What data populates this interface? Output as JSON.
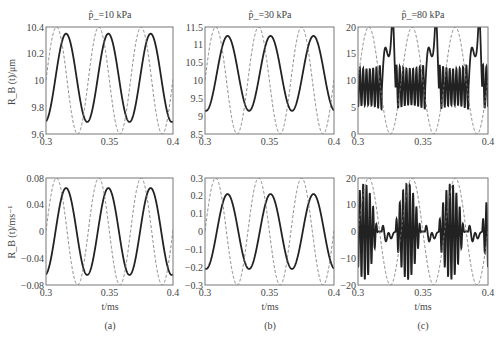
{
  "figure": {
    "captions": [
      "(a)",
      "(b)",
      "(c)"
    ],
    "xlabel": "t/ms",
    "top_ylabel": "R_B (t)/μm",
    "bottom_ylabel": "R_B (t)/ms⁻¹",
    "column_titles": [
      "p̂_=10 kPa",
      "p̂_=30 kPa",
      "p̂_=80 kPa"
    ]
  },
  "chart_data": [
    {
      "type": "line",
      "panel": "a-top",
      "title": "p̂_=10 kPa",
      "xlabel": "",
      "ylabel": "R_B (t)/μm",
      "xlim": [
        0.3,
        0.4
      ],
      "ylim": [
        9.6,
        10.4
      ],
      "xticks": [
        0.3,
        0.35,
        0.4
      ],
      "yticks": [
        9.6,
        9.8,
        10,
        10.2,
        10.4
      ],
      "ytick_labels": [
        "9.6",
        "9.8",
        "10",
        "10.2",
        "10.4"
      ],
      "series": [
        {
          "name": "bubble radius",
          "style": "solid",
          "mean": 10.02,
          "amplitude": 0.33,
          "period_ms": 0.0333,
          "first_peak_t": 0.3158,
          "peaks": [
            10.36,
            10.36,
            10.36
          ],
          "troughs": [
            9.69,
            9.69,
            9.69
          ]
        },
        {
          "name": "driving pressure (scaled)",
          "style": "dashed",
          "mean": 10.0,
          "amplitude": 0.4,
          "period_ms": 0.0333,
          "first_peak_t": 0.3083
        }
      ],
      "grid": false
    },
    {
      "type": "line",
      "panel": "b-top",
      "title": "p̂_=30 kPa",
      "xlabel": "",
      "ylabel": "",
      "xlim": [
        0.3,
        0.4
      ],
      "ylim": [
        8.5,
        11.5
      ],
      "xticks": [
        0.3,
        0.35,
        0.4
      ],
      "yticks": [
        8.5,
        9,
        9.5,
        10,
        10.5,
        11,
        11.5
      ],
      "ytick_labels": [
        "8.5",
        "9",
        "9.5",
        "10",
        "10.5",
        "11",
        "11.5"
      ],
      "series": [
        {
          "name": "bubble radius",
          "style": "solid",
          "mean": 10.2,
          "amplitude": 1.05,
          "period_ms": 0.0333,
          "first_peak_t": 0.3175,
          "peaks": [
            11.3,
            11.3,
            11.3
          ],
          "troughs": [
            9.1,
            9.2,
            9.2
          ]
        },
        {
          "name": "driving pressure (scaled)",
          "style": "dashed",
          "mean": 10.0,
          "amplitude": 1.5,
          "period_ms": 0.0333,
          "first_peak_t": 0.3083
        }
      ],
      "grid": false
    },
    {
      "type": "line",
      "panel": "c-top",
      "title": "p̂_=80 kPa",
      "xlabel": "",
      "ylabel": "",
      "xlim": [
        0.3,
        0.4
      ],
      "ylim": [
        0,
        20
      ],
      "xticks": [
        0.3,
        0.35,
        0.4
      ],
      "yticks": [
        0,
        5,
        10,
        15,
        20
      ],
      "ytick_labels": [
        "0",
        "5",
        "10",
        "15",
        "20"
      ],
      "series": [
        {
          "name": "bubble radius",
          "style": "solid",
          "description": "chaotic: dense high-frequency ringing between ~4.5 and ~13, then growth peaks ~15.5 and ~18.5 each cycle",
          "period_ms": 0.0333,
          "ring_range": [
            4.5,
            13
          ],
          "peaks": [
            18.5,
            19,
            19
          ]
        },
        {
          "name": "driving pressure (scaled)",
          "style": "dashed",
          "mean": 10.0,
          "amplitude": 10.0,
          "period_ms": 0.0333,
          "first_peak_t": 0.3083
        }
      ],
      "grid": false
    },
    {
      "type": "line",
      "panel": "a-bottom",
      "title": "",
      "xlabel": "t/ms",
      "ylabel": "R_B (t)/ms⁻¹",
      "xlim": [
        0.3,
        0.4
      ],
      "ylim": [
        -0.08,
        0.08
      ],
      "xticks": [
        0.3,
        0.35,
        0.4
      ],
      "yticks": [
        -0.08,
        -0.04,
        0,
        0.04,
        0.08
      ],
      "ytick_labels": [
        "-0.08",
        "-0.04",
        "0",
        "0.04",
        "0.08"
      ],
      "series": [
        {
          "name": "bubble wall velocity",
          "style": "solid",
          "mean": 0.0,
          "amplitude": 0.065,
          "period_ms": 0.0333,
          "first_peak_t": 0.3158
        },
        {
          "name": "driving pressure (scaled)",
          "style": "dashed",
          "mean": 0.0,
          "amplitude": 0.08,
          "period_ms": 0.0333,
          "first_peak_t": 0.3083
        }
      ],
      "grid": false
    },
    {
      "type": "line",
      "panel": "b-bottom",
      "title": "",
      "xlabel": "t/ms",
      "ylabel": "",
      "xlim": [
        0.3,
        0.4
      ],
      "ylim": [
        -0.3,
        0.3
      ],
      "xticks": [
        0.3,
        0.35,
        0.4
      ],
      "yticks": [
        -0.3,
        -0.2,
        -0.1,
        0,
        0.1,
        0.2,
        0.3
      ],
      "ytick_labels": [
        "-0.3",
        "-0.2",
        "-0.1",
        "0",
        "0.1",
        "0.2",
        "0.3"
      ],
      "series": [
        {
          "name": "bubble wall velocity",
          "style": "solid",
          "mean": 0.0,
          "amplitude": 0.21,
          "period_ms": 0.0333,
          "first_peak_t": 0.3175,
          "peaks": [
            0.22,
            0.21,
            0.21
          ],
          "troughs": [
            -0.2,
            -0.21,
            -0.21
          ]
        },
        {
          "name": "driving pressure (scaled)",
          "style": "dashed",
          "mean": 0.0,
          "amplitude": 0.3,
          "period_ms": 0.0333,
          "first_peak_t": 0.3083
        }
      ],
      "grid": false
    },
    {
      "type": "line",
      "panel": "c-bottom",
      "title": "",
      "xlabel": "t/ms",
      "ylabel": "",
      "xlim": [
        0.3,
        0.4
      ],
      "ylim": [
        -20,
        20
      ],
      "xticks": [
        0.3,
        0.35,
        0.4
      ],
      "yticks": [
        -20,
        -10,
        0,
        10,
        20
      ],
      "ytick_labels": [
        "-20",
        "-10",
        "0",
        "10",
        "20"
      ],
      "series": [
        {
          "name": "bubble wall velocity",
          "style": "solid",
          "description": "chaotic high-frequency bursts reaching about ±18, with small oscillations near 0 between bursts",
          "period_ms": 0.0333,
          "burst_amplitude": 18
        },
        {
          "name": "driving pressure (scaled)",
          "style": "dashed",
          "mean": 0.0,
          "amplitude": 20.0,
          "period_ms": 0.0333,
          "first_peak_t": 0.3083
        }
      ],
      "grid": false
    }
  ]
}
